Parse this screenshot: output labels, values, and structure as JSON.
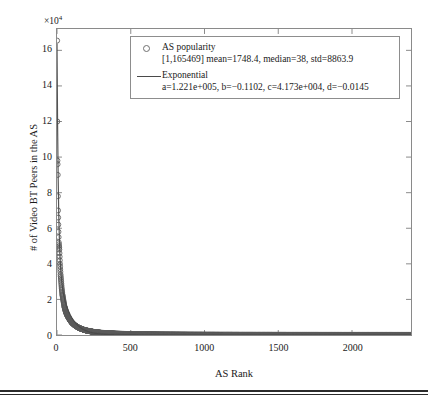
{
  "chart_data": {
    "type": "scatter",
    "title": "",
    "subtitle": "",
    "xlabel": "AS Rank",
    "ylabel": "# of Video BT Peers in the AS",
    "grid": false,
    "legend_position": "top-center",
    "y_exponent_label": "×10",
    "y_exponent_power": "4",
    "y_scale_factor": 10000,
    "xlim": [
      0,
      2400
    ],
    "ylim": [
      0,
      172000
    ],
    "xticks": [
      0,
      500,
      1000,
      1500,
      2000
    ],
    "xtick_labels": [
      "0",
      "500",
      "1000",
      "1500",
      "2000"
    ],
    "yticks": [
      0,
      20000,
      40000,
      60000,
      80000,
      100000,
      120000,
      140000,
      160000
    ],
    "ytick_labels": [
      "0",
      "2",
      "4",
      "6",
      "8",
      "10",
      "12",
      "14",
      "16"
    ],
    "series": [
      {
        "name": "AS popularity",
        "marker": "open-circle",
        "color": "#5a5a5a",
        "n_points": 2400,
        "x_min": 1,
        "x_max": 2400,
        "y_max": 165469,
        "y_min": 1,
        "mean": 1748.4,
        "median": 38,
        "std": 8863.9,
        "x": [
          1,
          2,
          3,
          4,
          5,
          6,
          7,
          8,
          9,
          10,
          12,
          14,
          16,
          18,
          20,
          24,
          28,
          32,
          36,
          40,
          50,
          60,
          70,
          80,
          90,
          100,
          120,
          140,
          160,
          180,
          200,
          250,
          300,
          400,
          500,
          700,
          900,
          1100,
          1400,
          1700,
          2000,
          2400
        ],
        "y": [
          165469,
          120000,
          98000,
          96000,
          90000,
          78000,
          70000,
          66000,
          62000,
          58000,
          52000,
          50000,
          48000,
          44000,
          40000,
          34000,
          30000,
          26000,
          23000,
          21000,
          16000,
          13000,
          11000,
          9500,
          8200,
          7000,
          5500,
          4400,
          3600,
          3000,
          2500,
          1700,
          1200,
          700,
          450,
          200,
          120,
          80,
          45,
          28,
          16,
          5
        ]
      },
      {
        "name": "Exponential",
        "marker": "line",
        "color": "#4a4a4a",
        "fit_form": "a*exp(b*x) + c*exp(d*x)",
        "a": 122100,
        "a_label": "1.221e+005",
        "b": -0.1102,
        "b_label": "−0.1102",
        "c": 41730,
        "c_label": "4.173e+004",
        "d": -0.0145,
        "d_label": "−0.0145"
      }
    ]
  },
  "legend": {
    "entries": [
      {
        "marker": "open-circle-marker",
        "title": "AS popularity",
        "detail": "[1,165469] mean=1748.4, median=38, std=8863.9"
      },
      {
        "marker": "solid-line-marker",
        "title": "Exponential",
        "detail": "a=1.221e+005, b=−0.1102, c=4.173e+004, d=−0.0145"
      }
    ]
  },
  "axes": {
    "x_title": "AS Rank",
    "y_title": "# of Video BT Peers in the AS",
    "y_exponent": "×10",
    "y_exponent_power": "4",
    "x_tick_labels": [
      "0",
      "500",
      "1000",
      "1500",
      "2000"
    ],
    "y_tick_labels": [
      "0",
      "2",
      "4",
      "6",
      "8",
      "10",
      "12",
      "14",
      "16"
    ]
  },
  "colors": {
    "frame": "#8a8a8a",
    "marker": "#5a5a5a",
    "fit_line": "#4a4a4a",
    "text": "#1a1a1a",
    "background": "#ffffff",
    "rule": "#2b2b2b"
  }
}
